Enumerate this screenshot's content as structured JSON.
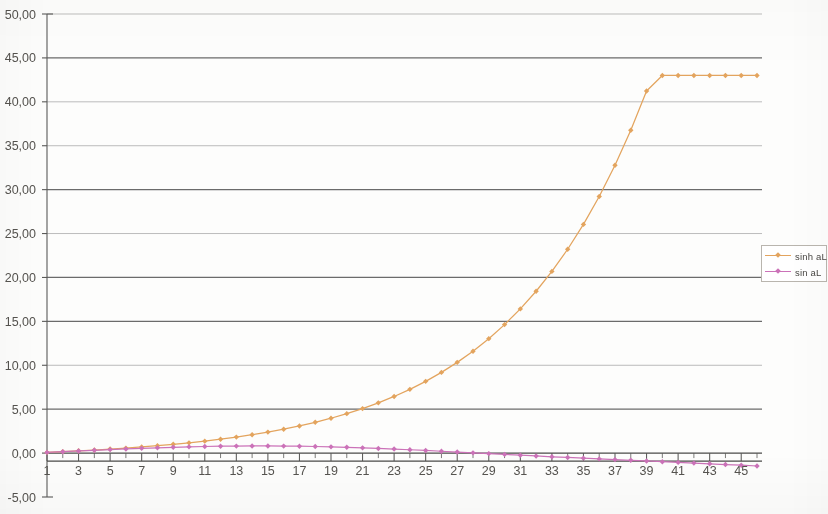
{
  "chart_data": {
    "type": "line",
    "title": "",
    "xlabel": "",
    "ylabel": "",
    "xlim": [
      1,
      46
    ],
    "ylim": [
      -5,
      50
    ],
    "grid": true,
    "legend_position": "right",
    "y_ticks": [
      "50,00",
      "45,00",
      "40,00",
      "35,00",
      "30,00",
      "25,00",
      "20,00",
      "15,00",
      "10,00",
      "5,00",
      "0,00",
      "-5,00"
    ],
    "y_tick_values": [
      50,
      45,
      40,
      35,
      30,
      25,
      20,
      15,
      10,
      5,
      0,
      -5
    ],
    "x_ticks": [
      "1",
      "3",
      "5",
      "7",
      "9",
      "11",
      "13",
      "15",
      "17",
      "19",
      "21",
      "23",
      "25",
      "27",
      "29",
      "31",
      "33",
      "35",
      "37",
      "39",
      "41",
      "43",
      "45"
    ],
    "x_tick_values": [
      1,
      3,
      5,
      7,
      9,
      11,
      13,
      15,
      17,
      19,
      21,
      23,
      25,
      27,
      29,
      31,
      33,
      35,
      37,
      39,
      41,
      43,
      45
    ],
    "x": [
      1,
      2,
      3,
      4,
      5,
      6,
      7,
      8,
      9,
      10,
      11,
      12,
      13,
      14,
      15,
      16,
      17,
      18,
      19,
      20,
      21,
      22,
      23,
      24,
      25,
      26,
      27,
      28,
      29,
      30,
      31,
      32,
      33,
      34,
      35,
      36,
      37,
      38,
      39,
      40,
      41,
      42,
      43,
      44,
      45,
      46
    ],
    "series": [
      {
        "name": "sinh aL",
        "color": "#E3A45E",
        "marker": "diamond",
        "values": [
          0.08,
          0.17,
          0.26,
          0.35,
          0.46,
          0.57,
          0.7,
          0.84,
          1.0,
          1.17,
          1.36,
          1.58,
          1.82,
          2.09,
          2.39,
          2.72,
          3.09,
          3.51,
          3.97,
          4.49,
          5.07,
          5.72,
          6.45,
          7.26,
          8.17,
          9.19,
          10.33,
          11.6,
          13.03,
          14.63,
          16.42,
          18.43,
          20.69,
          23.21,
          26.04,
          29.22,
          32.77,
          36.76,
          41.23,
          43.0,
          43.0,
          43.0,
          43.0,
          43.0,
          43.0,
          43.0
        ]
      },
      {
        "name": "sin aL",
        "color": "#CB72B8",
        "marker": "diamond",
        "values": [
          0.08,
          0.16,
          0.24,
          0.32,
          0.4,
          0.47,
          0.54,
          0.6,
          0.66,
          0.71,
          0.75,
          0.78,
          0.8,
          0.81,
          0.81,
          0.8,
          0.78,
          0.75,
          0.71,
          0.66,
          0.6,
          0.53,
          0.46,
          0.38,
          0.3,
          0.21,
          0.12,
          0.03,
          -0.06,
          -0.15,
          -0.24,
          -0.33,
          -0.42,
          -0.5,
          -0.58,
          -0.66,
          -0.74,
          -0.82,
          -0.9,
          -0.98,
          -1.06,
          -1.14,
          -1.22,
          -1.3,
          -1.38,
          -1.47
        ]
      }
    ]
  },
  "legend": {
    "entries": [
      {
        "label": "sinh aL"
      },
      {
        "label": "sin aL"
      }
    ]
  },
  "colors": {
    "sinh_series": "#E3A45E",
    "sin_series": "#CB72B8",
    "gridline_major": "#6b6b6b",
    "gridline_minor": "#b0b0b0",
    "axis": "#5a5a58",
    "tick_text": "#55534f",
    "background": "#ffffff"
  }
}
